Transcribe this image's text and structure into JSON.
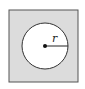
{
  "diagram": {
    "radius_label": "r",
    "colors": {
      "square_fill": "#dcdcdc",
      "square_stroke": "#555555",
      "circle_fill": "#ffffff",
      "circle_stroke": "#333333",
      "center_dot": "#111111",
      "radius_line": "#222222"
    }
  }
}
